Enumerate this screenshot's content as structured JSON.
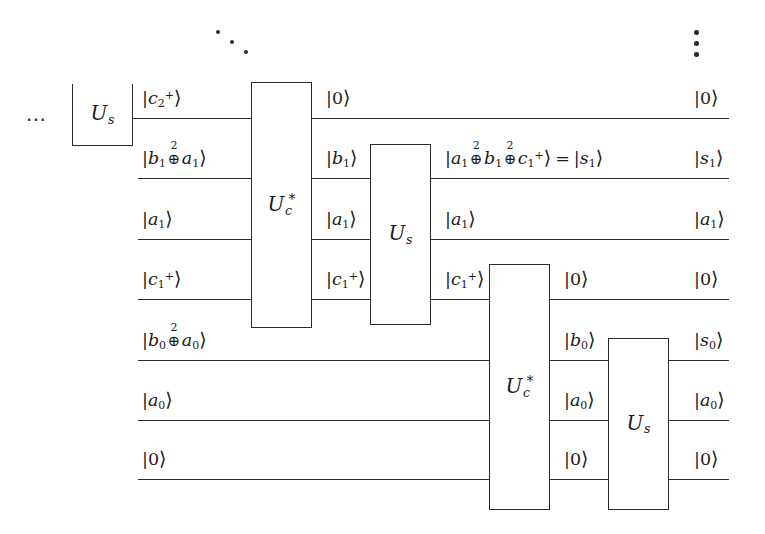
{
  "diagram": {
    "ellipsis_left": "⋯",
    "ellipsis_diagonal": "⋱",
    "ellipsis_vertical": "⋮",
    "line_color": "#2b2b2b",
    "background": "#ffffff"
  },
  "gates": [
    {
      "id": "us-0",
      "label_base": "U",
      "label_sub": "s",
      "label_star": "",
      "name": "gate-us-left"
    },
    {
      "id": "uc-1",
      "label_base": "U",
      "label_sub": "c",
      "label_star": "*",
      "name": "gate-uc-star-1"
    },
    {
      "id": "us-1",
      "label_base": "U",
      "label_sub": "s",
      "label_star": "",
      "name": "gate-us-1"
    },
    {
      "id": "uc-2",
      "label_base": "U",
      "label_sub": "c",
      "label_star": "*",
      "name": "gate-uc-star-2"
    },
    {
      "id": "us-2",
      "label_base": "U",
      "label_sub": "s",
      "label_star": "",
      "name": "gate-us-2"
    }
  ],
  "wires": [
    {
      "index": 0,
      "name": "wire-c2-carry"
    },
    {
      "index": 1,
      "name": "wire-b1-sum"
    },
    {
      "index": 2,
      "name": "wire-a1"
    },
    {
      "index": 3,
      "name": "wire-c1-carry"
    },
    {
      "index": 4,
      "name": "wire-b0-sum"
    },
    {
      "index": 5,
      "name": "wire-a0"
    },
    {
      "index": 6,
      "name": "wire-ancilla-zero"
    }
  ],
  "labels": {
    "c2_plus": {
      "text": "|c₂⁺⟩",
      "name": "ket-c2-plus"
    },
    "b1_xor_a1": {
      "text": "|b₁ ⊕² a₁⟩",
      "name": "ket-b1-xor-a1"
    },
    "a1_in": {
      "text": "|a₁⟩",
      "name": "ket-a1-input"
    },
    "c1_plus_in": {
      "text": "|c₁⁺⟩",
      "name": "ket-c1-plus-input"
    },
    "b0_xor_a0": {
      "text": "|b₀ ⊕² a₀⟩",
      "name": "ket-b0-xor-a0"
    },
    "a0_in": {
      "text": "|a₀⟩",
      "name": "ket-a0-input"
    },
    "zero_in": {
      "text": "|0⟩",
      "name": "ket-zero-input"
    },
    "zero_mid0": {
      "text": "|0⟩",
      "name": "ket-zero-after-uc1"
    },
    "b1_mid": {
      "text": "|b₁⟩",
      "name": "ket-b1-mid"
    },
    "a1_mid": {
      "text": "|a₁⟩",
      "name": "ket-a1-mid"
    },
    "c1_mid": {
      "text": "|c₁⁺⟩",
      "name": "ket-c1-plus-mid"
    },
    "s1_expr": {
      "text": "|a₁ ⊕² b₁ ⊕² c₁⁺⟩ = |s₁⟩",
      "name": "ket-s1-expression"
    },
    "a1_mid2": {
      "text": "|a₁⟩",
      "name": "ket-a1-after-us1"
    },
    "c1_mid2": {
      "text": "|c₁⁺⟩",
      "name": "ket-c1-plus-after-us1"
    },
    "zero_mid1": {
      "text": "|0⟩",
      "name": "ket-zero-after-us1"
    },
    "b0_mid": {
      "text": "|b₀⟩",
      "name": "ket-b0-mid"
    },
    "a0_mid": {
      "text": "|a₀⟩",
      "name": "ket-a0-mid"
    },
    "zero_mid2": {
      "text": "|0⟩",
      "name": "ket-zero-after-uc2"
    },
    "out_zero_0": {
      "text": "|0⟩",
      "name": "ket-out-zero-0"
    },
    "out_s1": {
      "text": "|s₁⟩",
      "name": "ket-out-s1"
    },
    "out_a1": {
      "text": "|a₁⟩",
      "name": "ket-out-a1"
    },
    "out_zero_3": {
      "text": "|0⟩",
      "name": "ket-out-zero-3"
    },
    "out_s0": {
      "text": "|s₀⟩",
      "name": "ket-out-s0"
    },
    "out_a0": {
      "text": "|a₀⟩",
      "name": "ket-out-a0"
    },
    "out_zero_6": {
      "text": "|0⟩",
      "name": "ket-out-zero-6"
    }
  }
}
